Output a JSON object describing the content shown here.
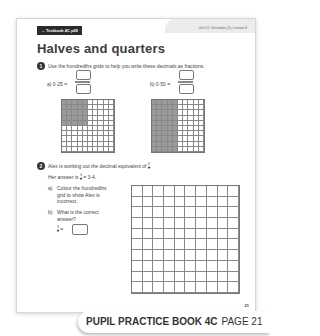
{
  "page": {
    "textbook_ref": "→ Textbook 4C p28",
    "unit_label": "Unit 11: Decimals (2), Lesson 6",
    "title": "Halves and quarters",
    "page_number": "21"
  },
  "question1": {
    "number": "1",
    "text": "Use the hundredths grids to help you write these decimals as fractions.",
    "parts": [
      {
        "label": "a)",
        "expression": "0·25 =",
        "numerator": "",
        "denominator": "",
        "grid_shaded": "rows 1-5, cols 1-5",
        "shaded_count": 25
      },
      {
        "label": "b)",
        "expression": "0·50 =",
        "numerator": "",
        "denominator": "",
        "grid_shaded": "cols 1-5, all rows",
        "shaded_count": 50
      }
    ]
  },
  "question2": {
    "number": "2",
    "text": "Alex is working out the decimal equivalent of",
    "fraction": {
      "numerator": "3",
      "denominator": "4"
    },
    "answer_prefix": "Her answer is",
    "answer_suffix": "= 3·4.",
    "part_a_label": "a)",
    "part_a_text": [
      "Colour the hundredths",
      "grid to show Alex is",
      "incorrect."
    ],
    "part_b_label": "b)",
    "part_b_text": [
      "What is the correct",
      "answer?"
    ],
    "part_b_eq": "=",
    "answer_value": ""
  },
  "footer": {
    "book": "PUPIL PRACTICE BOOK 4C",
    "page": "PAGE 21"
  }
}
